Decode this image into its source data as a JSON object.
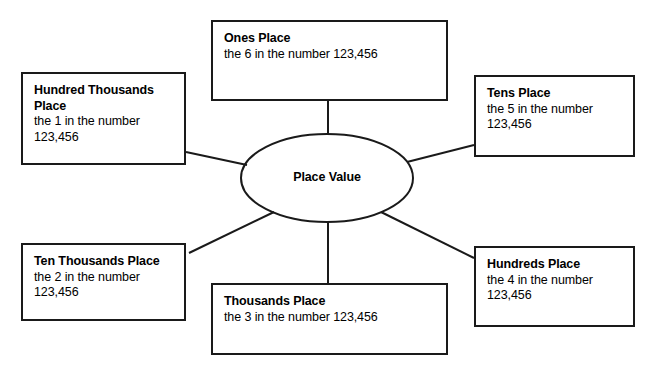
{
  "diagram": {
    "type": "concept-web",
    "hub": {
      "label": "Place Value"
    },
    "nodes": [
      {
        "id": "ones",
        "title": "Ones Place",
        "body": "the 6 in the number 123,456"
      },
      {
        "id": "hundred-thousands",
        "title": "Hundred Thousands Place",
        "body": "the 1 in the number 123,456"
      },
      {
        "id": "tens",
        "title": "Tens Place",
        "body": "the 5 in the number 123,456"
      },
      {
        "id": "ten-thousands",
        "title": "Ten Thousands Place",
        "body": "the 2 in the number 123,456"
      },
      {
        "id": "hundreds",
        "title": "Hundreds Place",
        "body": "the 4 in the number 123,456"
      },
      {
        "id": "thousands",
        "title": "Thousands Place",
        "body": "the 3 in the number 123,456"
      }
    ],
    "colors": {
      "stroke": "#1a1a1a",
      "background": "#ffffff",
      "text": "#000000"
    }
  }
}
